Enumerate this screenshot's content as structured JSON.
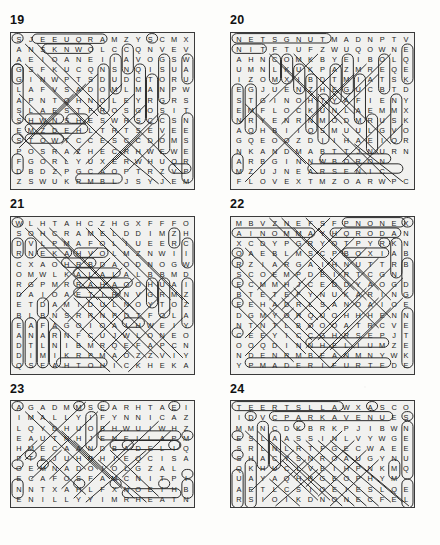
{
  "page": {
    "background_color": "#fdfdfb",
    "grid_fill_color": "#f1f1ef",
    "border_color": "#3a3a3a",
    "letter_color": "#1a1a1a",
    "mark_color": "#2b2b2b"
  },
  "puzzles": [
    {
      "number": "19",
      "cols": 16,
      "rows": 16,
      "rows_text": [
        "SJEEUQRAMZYSCMX",
        "ANSKNWOLCCQNVEV",
        "AEIOANEIIAVOGSW",
        "GSFKUCQNSNQISUA",
        "GINWPTSDUDCTORU",
        "LAFVSADOMLMANPW",
        "APNTQHNOLEYRGRS",
        "SLAESTFROSGOSIT",
        "SHWNSHESWRSCCSN",
        "EMZDEHLTRTSEVEE",
        "STOWTCCESCCDOMS",
        "POSRAZHECRHWEWE",
        "FGORLYUXERWHUQR",
        "DBDZPGCAOPTRZVP",
        "ZSWUKRMBLJSYJEM"
      ]
    },
    {
      "number": "20",
      "cols": 16,
      "rows": 16,
      "rows_text": [
        "NETSGNUTMADNPTV",
        "NITFTUFZWUQOWNE",
        "AHNCOMKBYEIBOLQ",
        "UMNLKUKPAZMREQE",
        "IZOMXIBDTMIATSK",
        "EGJUENZHEGUCBTD",
        "STGINOHTYAFIENY",
        "EMFLOCKUNLAEMMX",
        "NRYENRNMODMRUSK",
        "AOHBIIOSMUULGVO",
        "GQEOOZDIIHAEIOR",
        "NKANDMABTTJNURN",
        "ARBGINNWBORON",
        "MZUJNEARSENIC",
        "FLOVEXTMZOARWPC"
      ]
    },
    {
      "number": "21",
      "cols": 16,
      "rows": 16,
      "rows_text": [
        "WLHTAHCZHGXFFFO",
        "SOHCRAMELDDIMZH",
        "DVLPMAFOLIUEERC",
        "RNEKAHVOLMZNWII",
        "CXAOHRBDAODNOGW",
        "OMWLKALALALBBMD",
        "RGPMRRAHAOOHUAI",
        "DAIOAETIRNVGRMZ",
        "ETDAMIDULNOYTOZ",
        "BLBNSRRNPDTFOLA",
        "EAFAGOIOAIHWEIY",
        "ANARNFCUJWLONEO",
        "DTLNIBMRQEFAPCN",
        "DIMIKRPMAOZZVIY",
        "QSEAHTOHICKHEKA"
      ]
    },
    {
      "number": "22",
      "cols": 16,
      "rows": 16,
      "rows_text": [
        "MBVZNEFSFPNONEX",
        "AINOMMAYHQRODAN",
        "XCDYPGRYOTPYRKNY",
        "OAEBLMSCPBOXIAB",
        "RZIARGAIHNUTTRB",
        "SCOEMPDEIRTCGN",
        "ECMMHJCEDDYAOGD",
        "BTETEFYNUKARING",
        "EEHADRLSANOAIOE",
        "DGMYORQUOHHHENN",
        "NTNTLBOOOATRCVE",
        "CEEYICCGHRSEPJT",
        "OOQDINNHELIUMZE",
        "NDENRMBEANMNYWK",
        "YPMADERIFURTEDE"
      ]
    },
    {
      "number": "23",
      "cols": 16,
      "rows": 11,
      "rows_text": [
        "AGADMMSEARHTAEI",
        "IMALLYIFYNNICAZ",
        "LQYDHUOBHWUIWHZ",
        "EAUTNHJENELLAPM",
        "HMECAANDBADELIQ",
        "PTEJUHRHIEQCISA",
        "OEMNADOIOLGZAL",
        "ECAFOSFAMCNITPI",
        "NNTXAHLFXNOEIHB",
        "ENILLYYIMRHEATN"
      ]
    },
    {
      "number": "24",
      "cols": 16,
      "rows": 11,
      "rows_text": [
        "TEERTSLLAWXASCO",
        "IDVCPARKAVENUES",
        "MMNCDKBRKPJIBWN",
        "ESLAASSINLVYWGE",
        "SRLNLRTFGECWAEE",
        "SHACYSNROAUGYNU",
        "QKHUCLVEIHPNKMQ",
        "UAYAQHRGEOPHYM",
        "AETLCSIOEIESLQE",
        "RSIOIKDNONECFEL"
      ]
    }
  ]
}
